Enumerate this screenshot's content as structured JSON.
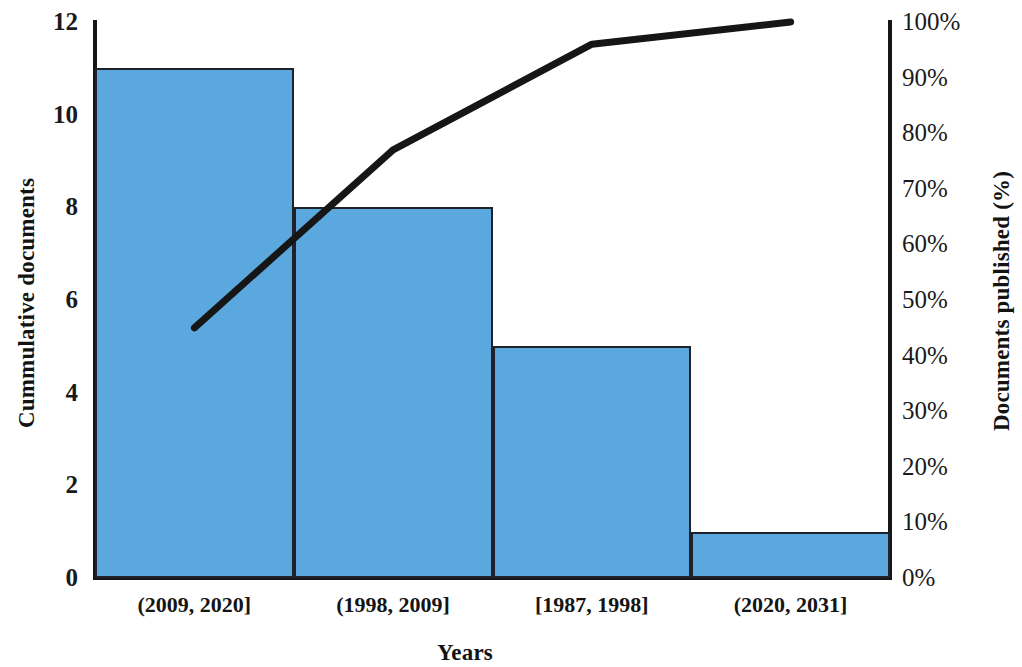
{
  "chart_data": {
    "type": "bar",
    "title": "",
    "subtitle": "",
    "xlabel": "Years",
    "ylabel": "Cummulative documents",
    "y2label": "Documents published (%)",
    "categories": [
      "(2009, 2020]",
      "(1998, 2009]",
      "[1987, 1998]",
      "(2020, 2031]"
    ],
    "values": [
      11,
      8,
      5,
      1
    ],
    "ylim": [
      0,
      12
    ],
    "y_ticks": [
      0,
      2,
      4,
      6,
      8,
      10,
      12
    ],
    "y_tick_labels": [
      "0",
      "2",
      "4",
      "6",
      "8",
      "10",
      "12"
    ],
    "y2lim": [
      0,
      100
    ],
    "y2_ticks": [
      0,
      10,
      20,
      30,
      40,
      50,
      60,
      70,
      80,
      90,
      100
    ],
    "y2_tick_labels": [
      "0%",
      "10%",
      "20%",
      "30%",
      "40%",
      "50%",
      "60%",
      "70%",
      "80%",
      "90%",
      "100%"
    ],
    "grid": false,
    "legend": "none",
    "series": [
      {
        "name": "Cummulative documents",
        "type": "bar",
        "axis": "left",
        "values": [
          11,
          8,
          5,
          1
        ],
        "color": "#5ba8df",
        "edge_color": "#20222b"
      },
      {
        "name": "Documents published (%)",
        "type": "line",
        "axis": "right",
        "values": [
          45,
          77,
          96,
          100
        ],
        "color": "#161616"
      }
    ]
  },
  "axes": {
    "left_title": "Cummulative documents",
    "right_title": "Documents published (%)",
    "x_title": "Years"
  },
  "colors": {
    "bar_fill": "#5ba8df",
    "bar_edge": "#20222b",
    "line": "#161616",
    "axis": "#161616",
    "background": "#ffffff",
    "text": "#141414"
  }
}
